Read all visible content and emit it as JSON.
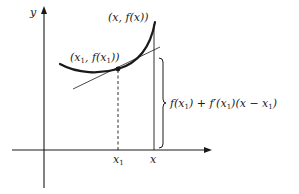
{
  "diagram": {
    "type": "tangent-line-approximation",
    "axes": {
      "y_label": "y",
      "x_ticks": [
        {
          "label": "x",
          "sub": "1"
        },
        {
          "label": "x",
          "sub": ""
        }
      ]
    },
    "points": {
      "point_x1": {
        "label_prefix": "(x",
        "label_sub": "1",
        "label_mid": ", f(x",
        "label_sub2": "1",
        "label_suffix": "))"
      },
      "point_x": {
        "label": "(x, f(x))"
      }
    },
    "brace_formula": {
      "part1": "f(x",
      "sub1": "1",
      "part2": ") + f′(x",
      "sub2": "1",
      "part3": ")(x − x",
      "sub3": "1",
      "part4": ")"
    },
    "colors": {
      "stroke": "#1a1a1a",
      "background": "#ffffff"
    }
  }
}
